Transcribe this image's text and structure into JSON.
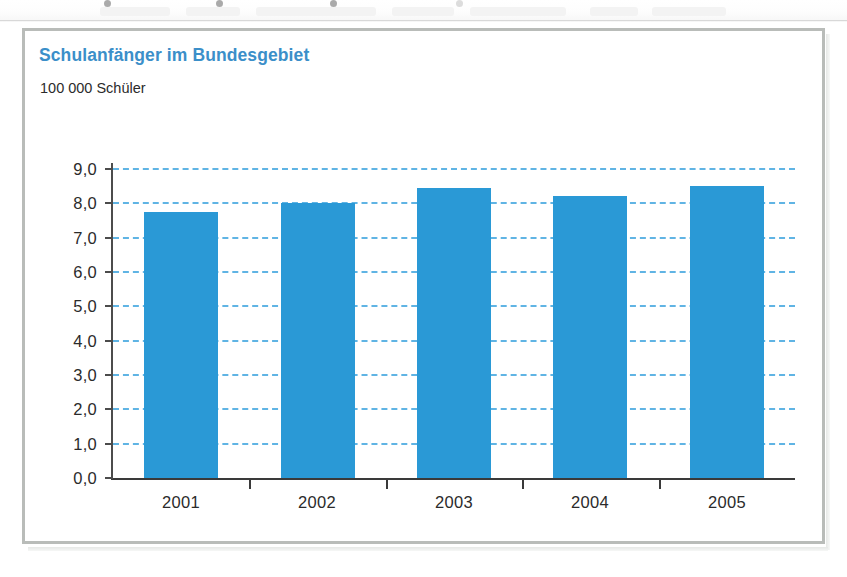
{
  "panel": {
    "border_color": "#b9bcb9",
    "background": "#ffffff"
  },
  "chart_data": {
    "type": "bar",
    "title": "Schulanfänger im Bundesgebiet",
    "subtitle": "100 000 Schüler",
    "xlabel": "",
    "ylabel": "100 000 Schüler",
    "categories": [
      "2001",
      "2002",
      "2003",
      "2004",
      "2005"
    ],
    "values": [
      7.75,
      8.0,
      8.45,
      8.2,
      8.5
    ],
    "ylim": [
      0.0,
      9.0
    ],
    "ytick_values": [
      0.0,
      1.0,
      2.0,
      3.0,
      4.0,
      5.0,
      6.0,
      7.0,
      8.0,
      9.0
    ],
    "ytick_labels": [
      "0,0",
      "1,0",
      "2,0",
      "3,0",
      "4,0",
      "5,0",
      "6,0",
      "7,0",
      "8,0",
      "9,0"
    ],
    "grid": true,
    "grid_axis": "y",
    "grid_style": "dashed",
    "grid_color": "#45a8e0",
    "legend": false,
    "legend_position": "none",
    "bar_color": "#2a99d6",
    "title_color": "#3b8fc9",
    "axis_color": "#3a3a3a",
    "decimal_separator": ",",
    "annotations": []
  }
}
